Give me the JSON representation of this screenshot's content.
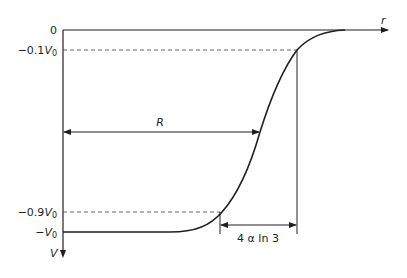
{
  "diagram": {
    "axes": {
      "x_label": "r",
      "y_label": "V"
    },
    "y_ticks": [
      {
        "id": "zero",
        "label": "0"
      },
      {
        "id": "tenth",
        "label_prefix": "−0.1",
        "label_var": "V",
        "label_sub": "0"
      },
      {
        "id": "ninetenths",
        "label_prefix": "−0.9",
        "label_var": "V",
        "label_sub": "0"
      },
      {
        "id": "full",
        "label_prefix": "−",
        "label_var": "V",
        "label_sub": "0"
      }
    ],
    "annotations": {
      "radius_label": "R",
      "width_label": "4 α ln 3"
    },
    "colors": {
      "ink": "#231f20",
      "dashed": "#555555",
      "background": "#ffffff"
    }
  }
}
